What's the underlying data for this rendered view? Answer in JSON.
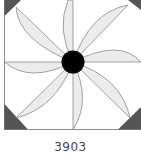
{
  "block": {
    "pattern_number": "3903",
    "colors": {
      "background": "#ffffff",
      "petal_fill": "#ececec",
      "outline": "#8a8a8a",
      "corner_fill": "#555555",
      "center_fill": "#000000"
    },
    "petal_count": 8,
    "corner_triangles": 4
  }
}
